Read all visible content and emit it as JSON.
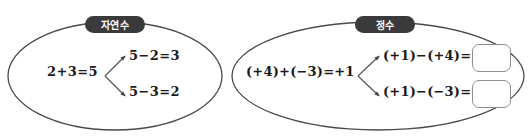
{
  "groups": [
    {
      "id": "natural-numbers",
      "label": "자연수",
      "main_equation": "2+3=5",
      "branches": [
        {
          "equation": "5−2=3",
          "answer": ""
        },
        {
          "equation": "5−3=2",
          "answer": ""
        }
      ]
    },
    {
      "id": "integers",
      "label": "정수",
      "main_equation": "(+4)+(−3)=+1",
      "branches": [
        {
          "equation": "(+1)−(+4)=",
          "answer": ""
        },
        {
          "equation": "(+1)−(−3)=",
          "answer": ""
        }
      ]
    }
  ],
  "colors": {
    "pill_background": "#3a3a3c",
    "pill_text": "#ffffff",
    "ellipse_stroke": "#4a4a4c",
    "text": "#1b1b1b",
    "answer_box_border": "#8d8d8f",
    "page_background": "#ffffff"
  }
}
